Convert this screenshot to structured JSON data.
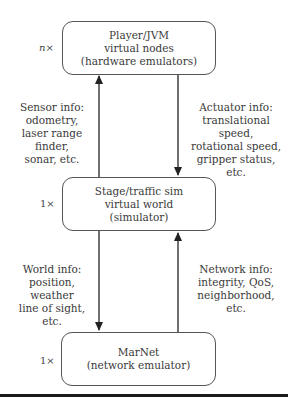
{
  "diagram": {
    "nodes": [
      {
        "id": "player",
        "multiplicity": "n×",
        "lines": [
          "Player/JVM",
          "virtual nodes",
          "(hardware emulators)"
        ]
      },
      {
        "id": "stage",
        "multiplicity": "1×",
        "lines": [
          "Stage/traffic sim",
          "virtual world",
          "(simulator)"
        ]
      },
      {
        "id": "marnet",
        "multiplicity": "1×",
        "lines": [
          "MarNet",
          "(network emulator)"
        ]
      }
    ],
    "edges": [
      {
        "from": "stage",
        "to": "player",
        "side": "left",
        "lines": [
          "Sensor info:",
          "odometry,",
          "laser range finder,",
          "sonar, etc."
        ]
      },
      {
        "from": "player",
        "to": "stage",
        "side": "right",
        "lines": [
          "Actuator info:",
          "translational speed,",
          "rotational speed,",
          "gripper status, etc."
        ]
      },
      {
        "from": "stage",
        "to": "marnet",
        "side": "left",
        "lines": [
          "World info:",
          "position, weather",
          "line of sight, etc."
        ]
      },
      {
        "from": "marnet",
        "to": "stage",
        "side": "right",
        "lines": [
          "Network info:",
          "integrity, QoS,",
          "neighborhood, etc."
        ]
      }
    ]
  }
}
